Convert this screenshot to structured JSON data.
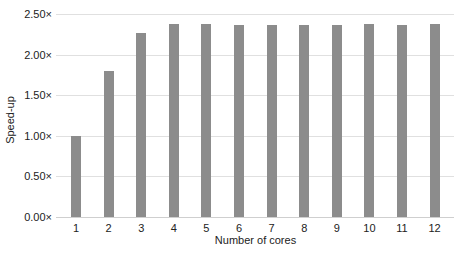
{
  "chart_data": {
    "type": "bar",
    "title": "",
    "xlabel": "Number of cores",
    "ylabel": "Speed-up",
    "categories": [
      "1",
      "2",
      "3",
      "4",
      "5",
      "6",
      "7",
      "8",
      "9",
      "10",
      "11",
      "12"
    ],
    "values": [
      1.0,
      1.8,
      2.27,
      2.38,
      2.38,
      2.37,
      2.37,
      2.37,
      2.37,
      2.38,
      2.37,
      2.38
    ],
    "ylim": [
      0,
      2.5
    ],
    "yticks": [
      "0.00×",
      "0.50×",
      "1.00×",
      "1.50×",
      "2.00×",
      "2.50×"
    ],
    "ytick_values": [
      0,
      0.5,
      1.0,
      1.5,
      2.0,
      2.5
    ],
    "grid": true,
    "legend": null,
    "bar_color": "#8c8c8c"
  }
}
